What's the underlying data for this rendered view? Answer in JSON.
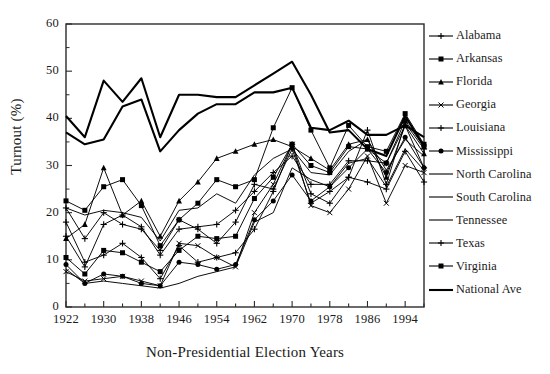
{
  "chart_data": {
    "type": "line",
    "title": "",
    "xlabel": "Non-Presidential Election Years",
    "ylabel": "Turnout (%)",
    "xlim": [
      1922,
      1998
    ],
    "ylim": [
      0,
      60
    ],
    "xticks": [
      1922,
      1930,
      1938,
      1946,
      1954,
      1962,
      1970,
      1978,
      1986,
      1994
    ],
    "yticks": [
      0,
      10,
      20,
      30,
      40,
      50,
      60
    ],
    "minor_x_step": 4,
    "grid": false,
    "legend_position": "right",
    "x": [
      1922,
      1926,
      1930,
      1934,
      1938,
      1942,
      1946,
      1950,
      1954,
      1958,
      1962,
      1966,
      1970,
      1974,
      1978,
      1982,
      1986,
      1990,
      1994,
      1998
    ],
    "series": [
      {
        "name": "Alabama",
        "marker": "plus",
        "values": [
          18.0,
          9.5,
          11.0,
          13.5,
          10.5,
          6.0,
          13.0,
          9.5,
          10.5,
          11.5,
          16.5,
          24.5,
          34.5,
          24.0,
          22.0,
          27.5,
          37.5,
          26.0,
          39.0,
          33.5
        ]
      },
      {
        "name": "Arkansas",
        "marker": "square",
        "values": [
          22.5,
          20.5,
          25.5,
          27.0,
          21.5,
          13.0,
          18.5,
          22.0,
          27.0,
          25.5,
          27.0,
          38.0,
          46.5,
          37.5,
          29.5,
          38.5,
          34.0,
          33.0,
          41.0,
          34.5
        ]
      },
      {
        "name": "Florida",
        "marker": "triangle",
        "values": [
          14.5,
          17.5,
          29.5,
          19.5,
          22.5,
          15.0,
          22.5,
          26.5,
          31.5,
          33.0,
          34.5,
          35.5,
          34.0,
          31.5,
          29.0,
          34.5,
          35.5,
          27.5,
          38.5,
          32.5
        ]
      },
      {
        "name": "Georgia",
        "marker": "x",
        "values": [
          7.5,
          5.5,
          6.0,
          6.5,
          5.5,
          4.5,
          13.5,
          13.0,
          10.5,
          8.5,
          20.0,
          26.0,
          34.5,
          21.5,
          20.0,
          25.0,
          32.0,
          22.0,
          30.0,
          28.5
        ]
      },
      {
        "name": "Louisiana",
        "marker": "plus",
        "values": [
          15.0,
          8.5,
          17.5,
          19.5,
          17.0,
          11.0,
          16.5,
          17.0,
          17.5,
          20.5,
          24.5,
          28.5,
          32.0,
          26.0,
          26.0,
          31.0,
          31.0,
          30.5,
          38.5,
          29.5
        ]
      },
      {
        "name": "Mississippi",
        "marker": "circle",
        "values": [
          9.0,
          5.0,
          7.0,
          6.5,
          5.0,
          4.5,
          9.5,
          9.0,
          8.0,
          9.0,
          18.5,
          22.5,
          28.0,
          22.5,
          25.5,
          29.5,
          33.5,
          28.5,
          36.0,
          29.5
        ]
      },
      {
        "name": "North Carolina",
        "marker": "none",
        "values": [
          21.0,
          19.5,
          20.5,
          20.0,
          19.0,
          14.0,
          20.5,
          21.0,
          24.0,
          22.0,
          28.0,
          31.5,
          33.5,
          28.5,
          28.0,
          33.0,
          35.5,
          29.0,
          35.5,
          32.0
        ]
      },
      {
        "name": "South Carolina",
        "marker": "none",
        "values": [
          8.0,
          5.0,
          5.5,
          5.0,
          4.5,
          4.0,
          5.0,
          6.5,
          7.5,
          8.5,
          18.0,
          20.0,
          29.5,
          27.0,
          25.5,
          30.5,
          31.5,
          25.5,
          33.5,
          29.0
        ]
      },
      {
        "name": "Tennessee",
        "marker": "none",
        "values": [
          40.5,
          36.0,
          48.0,
          43.5,
          48.5,
          36.0,
          45.0,
          45.0,
          44.5,
          44.5,
          47.0,
          49.5,
          52.0,
          45.0,
          37.0,
          37.5,
          33.5,
          32.0,
          40.5,
          34.0
        ]
      },
      {
        "name": "Texas",
        "marker": "plus",
        "values": [
          21.0,
          14.5,
          20.0,
          17.5,
          16.5,
          12.0,
          18.5,
          16.5,
          13.5,
          18.0,
          26.0,
          25.0,
          33.5,
          22.0,
          24.5,
          27.5,
          26.5,
          25.0,
          33.0,
          26.5
        ]
      },
      {
        "name": "Virginia",
        "marker": "square",
        "values": [
          10.5,
          7.0,
          12.0,
          11.5,
          9.5,
          7.5,
          12.0,
          15.0,
          14.5,
          15.0,
          23.0,
          27.5,
          34.5,
          30.0,
          28.5,
          34.0,
          33.5,
          30.5,
          39.5,
          34.0
        ]
      },
      {
        "name": "National Ave",
        "marker": "none",
        "values": [
          37.0,
          34.5,
          35.5,
          42.5,
          44.0,
          33.0,
          37.5,
          41.0,
          43.0,
          43.0,
          45.5,
          45.5,
          46.5,
          38.0,
          37.5,
          39.5,
          36.5,
          36.5,
          38.5,
          36.0
        ]
      }
    ]
  },
  "axes": {
    "ylabel": "Turnout (%)",
    "xlabel": "Non-Presidential Election Years",
    "xtick_labels": [
      "1922",
      "1930",
      "1938",
      "1946",
      "1954",
      "1962",
      "1970",
      "1978",
      "1986",
      "1994"
    ],
    "ytick_labels": [
      "0",
      "10",
      "20",
      "30",
      "40",
      "50",
      "60"
    ]
  },
  "legend": {
    "items": [
      {
        "label": "Alabama",
        "marker": "plus-marker"
      },
      {
        "label": "Arkansas",
        "marker": "square-marker"
      },
      {
        "label": "Florida",
        "marker": "triangle-marker"
      },
      {
        "label": "Georgia",
        "marker": "x-marker"
      },
      {
        "label": "Louisiana",
        "marker": "plus-marker"
      },
      {
        "label": "Mississippi",
        "marker": "circle-marker"
      },
      {
        "label": "North Carolina",
        "marker": "line-marker"
      },
      {
        "label": "South Carolina",
        "marker": "line-marker"
      },
      {
        "label": "Tennessee",
        "marker": "line-marker"
      },
      {
        "label": "Texas",
        "marker": "plus-marker"
      },
      {
        "label": "Virginia",
        "marker": "square-marker"
      },
      {
        "label": "National Ave",
        "marker": "thick-line-marker"
      }
    ]
  },
  "colors": {
    "line": "#000000",
    "axis": "#2b2b2b",
    "background": "#ffffff",
    "text": "#1a1a1a"
  }
}
